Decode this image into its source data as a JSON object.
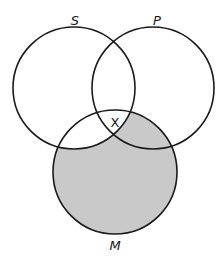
{
  "diagram": {
    "type": "venn-3",
    "shade_color": "#c9c9c9",
    "line_color": "#1a1a1a",
    "circles": [
      {
        "id": "S",
        "label": "S",
        "cx": 74,
        "cy": 88,
        "r": 61,
        "label_x": 75,
        "label_y": 25
      },
      {
        "id": "P",
        "label": "P",
        "cx": 153,
        "cy": 88,
        "r": 61,
        "label_x": 157,
        "label_y": 25
      },
      {
        "id": "M",
        "label": "M",
        "cx": 115,
        "cy": 172,
        "r": 62,
        "label_x": 115,
        "label_y": 250
      }
    ],
    "shaded_region": "M minus S",
    "marker": {
      "text": "X",
      "x": 115,
      "y": 127,
      "region": "S ∩ P ∩ M"
    }
  }
}
